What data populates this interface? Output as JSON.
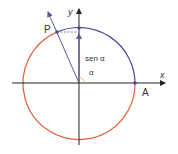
{
  "diagram": {
    "labels": {
      "x_axis": "x",
      "y_axis": "y",
      "point_p": "P",
      "point_a": "A",
      "sine": "sen α",
      "angle": "α"
    },
    "colors": {
      "arc_blue": "#4a4a9c",
      "arc_red": "#e0603a",
      "axis": "#222222",
      "ray": "#5a5aa0",
      "point": "#4a4a9c",
      "angle_mark": "#e89a70"
    },
    "geometry": {
      "center": [
        79,
        83
      ],
      "radius": 56,
      "point_p": [
        57,
        32
      ],
      "point_a": [
        135,
        83
      ],
      "point_top": [
        79,
        27
      ]
    }
  }
}
